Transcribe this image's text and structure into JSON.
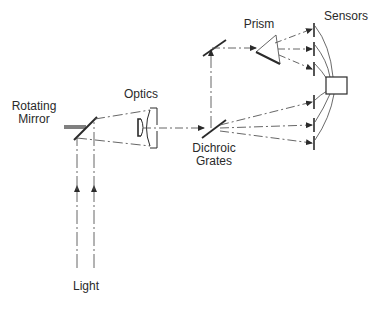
{
  "labels": {
    "rotating_mirror_line1": "Rotating",
    "rotating_mirror_line2": "Mirror",
    "optics": "Optics",
    "dichroic_line1": "Dichroic",
    "dichroic_line2": "Grates",
    "prism": "Prism",
    "sensors": "Sensors",
    "light": "Light"
  },
  "colors": {
    "stroke": "#2a2a2a",
    "beam": "#555555",
    "background": "#ffffff"
  },
  "components": [
    {
      "id": "rotating-mirror",
      "label": "Rotating Mirror"
    },
    {
      "id": "optics",
      "label": "Optics"
    },
    {
      "id": "dichroic-grates",
      "label": "Dichroic Grates"
    },
    {
      "id": "fold-mirror",
      "label": ""
    },
    {
      "id": "prism",
      "label": "Prism"
    },
    {
      "id": "sensors",
      "label": "Sensors",
      "count": 6
    },
    {
      "id": "processor-box",
      "label": ""
    },
    {
      "id": "light-input",
      "label": "Light"
    }
  ]
}
